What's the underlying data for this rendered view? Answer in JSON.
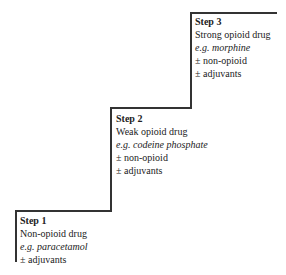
{
  "steps": [
    {
      "title": "Step 1",
      "drug": "Non-opioid drug",
      "example": "e.g. paracetamol",
      "extra1": "± adjuvants",
      "extra2": ""
    },
    {
      "title": "Step 2",
      "drug": "Weak opioid drug",
      "example": "e.g. codeine phosphate",
      "extra1": "± non-opioid",
      "extra2": "± adjuvants"
    },
    {
      "title": "Step 3",
      "drug": "Strong opioid drug",
      "example": "e.g. morphine",
      "extra1": "± non-opioid",
      "extra2": "± adjuvants"
    }
  ],
  "colors": {
    "line": "#333333",
    "text": "#222222"
  }
}
